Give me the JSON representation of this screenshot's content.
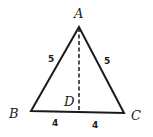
{
  "diagram": {
    "type": "isosceles-triangle",
    "vertices": {
      "A": {
        "label": "A",
        "x": 79,
        "y": 27
      },
      "B": {
        "label": "B",
        "x": 31,
        "y": 111
      },
      "C": {
        "label": "C",
        "x": 124,
        "y": 113
      },
      "D": {
        "label": "D",
        "x": 79,
        "y": 112
      }
    },
    "sides": {
      "AB": {
        "label": "5"
      },
      "AC": {
        "label": "5"
      },
      "BD": {
        "label": "4"
      },
      "DC": {
        "label": "4"
      }
    },
    "altitude": {
      "from": "A",
      "to": "D",
      "style": "dashed"
    },
    "colors": {
      "stroke": "#1a1a1a",
      "background": "#ffffff"
    }
  }
}
